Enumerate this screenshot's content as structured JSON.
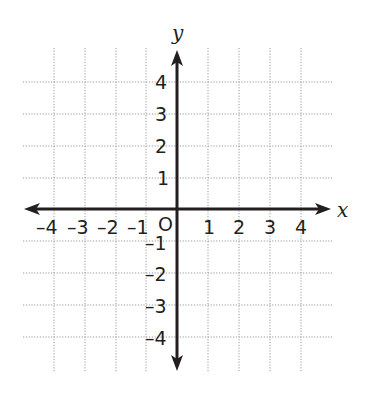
{
  "diagram": {
    "type": "coordinate-plane",
    "x_axis": {
      "label": "x",
      "ticks": [
        "-4",
        "-3",
        "-2",
        "-1",
        "1",
        "2",
        "3",
        "4"
      ],
      "range": [
        -4,
        4
      ]
    },
    "y_axis": {
      "label": "y",
      "ticks": [
        "4",
        "3",
        "2",
        "1",
        "-1",
        "-2",
        "-3",
        "-4"
      ],
      "range": [
        -4,
        4
      ]
    },
    "origin_label": "O",
    "grid": "dotted",
    "colors": {
      "axis": "#231f20",
      "grid": "#9a9a9a",
      "background": "#ffffff"
    }
  }
}
